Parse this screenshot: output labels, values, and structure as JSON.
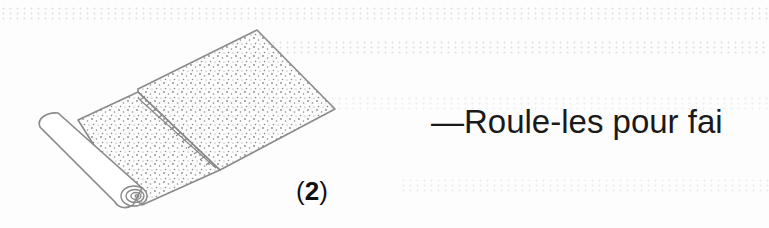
{
  "page": {
    "background": "#fdfdfd",
    "ink_color": "#1a1a1a",
    "illustration_color": "#8a8a8a"
  },
  "figure": {
    "icon": "rolled-rug-illustration",
    "step_open": "(",
    "step_number": "2",
    "step_close": ")"
  },
  "instruction": {
    "text": "—Roule-les pour fai"
  }
}
